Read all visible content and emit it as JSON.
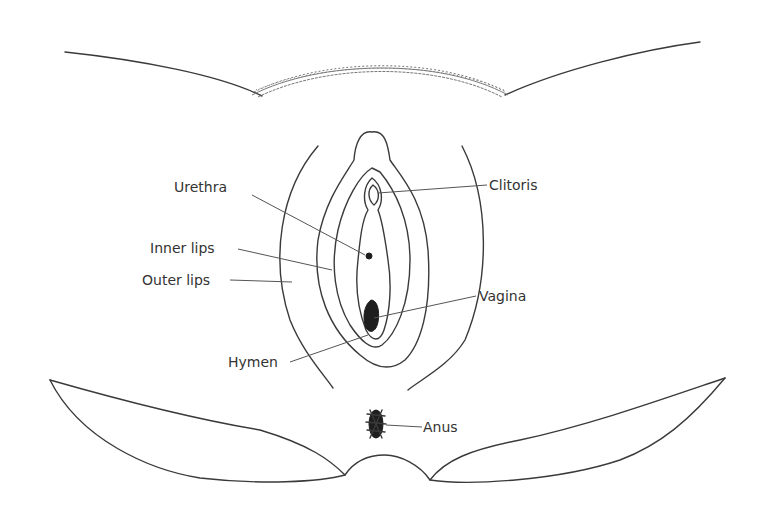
{
  "diagram": {
    "type": "anatomical-illustration",
    "labels": [
      {
        "id": "urethra",
        "text": "Urethra"
      },
      {
        "id": "inner-lips",
        "text": "Inner lips"
      },
      {
        "id": "outer-lips",
        "text": "Outer lips"
      },
      {
        "id": "hymen",
        "text": "Hymen"
      },
      {
        "id": "clitoris",
        "text": "Clitoris"
      },
      {
        "id": "vagina",
        "text": "Vagina"
      },
      {
        "id": "anus",
        "text": "Anus"
      }
    ],
    "colors": {
      "line": "#3a3a3a",
      "label": "#333333",
      "background": "#ffffff"
    }
  }
}
